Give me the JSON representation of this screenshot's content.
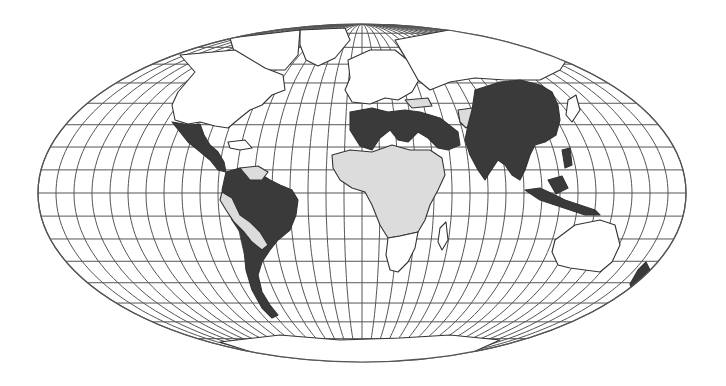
{
  "map": {
    "projection": "mollweide",
    "width": 726,
    "height": 386,
    "ellipse": {
      "cx": 362,
      "cy": 193,
      "rx": 324,
      "ry": 169
    },
    "graticule": {
      "meridian_step_deg": 10,
      "parallel_step_deg": 10
    },
    "colors": {
      "background": "#ffffff",
      "ocean": "#ffffff",
      "grid": "#555555",
      "border": "#333333",
      "category_dark": "#3a3a3a",
      "category_light": "#dcdcdc",
      "category_none": "#ffffff"
    },
    "legend_categories": [
      {
        "key": "dark",
        "fill": "#3a3a3a"
      },
      {
        "key": "light",
        "fill": "#dcdcdc"
      },
      {
        "key": "none",
        "fill": "#ffffff"
      }
    ],
    "regions": [
      {
        "name": "north-america",
        "category": "none"
      },
      {
        "name": "mexico-central-america",
        "category": "dark"
      },
      {
        "name": "caribbean",
        "category": "none"
      },
      {
        "name": "venezuela-guyanas",
        "category": "light"
      },
      {
        "name": "colombia-brazil-argentina-chile",
        "category": "dark"
      },
      {
        "name": "peru-bolivia-paraguay",
        "category": "light"
      },
      {
        "name": "europe",
        "category": "none"
      },
      {
        "name": "russia",
        "category": "none"
      },
      {
        "name": "north-africa-arabia",
        "category": "dark"
      },
      {
        "name": "sub-saharan-africa",
        "category": "light"
      },
      {
        "name": "southern-africa",
        "category": "none"
      },
      {
        "name": "turkey",
        "category": "light"
      },
      {
        "name": "iran",
        "category": "light"
      },
      {
        "name": "china-india-se-asia",
        "category": "dark"
      },
      {
        "name": "indonesia-philippines",
        "category": "dark"
      },
      {
        "name": "japan",
        "category": "none"
      },
      {
        "name": "australia",
        "category": "none"
      },
      {
        "name": "new-zealand",
        "category": "none"
      },
      {
        "name": "madagascar",
        "category": "none"
      },
      {
        "name": "greenland",
        "category": "none"
      },
      {
        "name": "antarctica",
        "category": "none"
      }
    ]
  }
}
